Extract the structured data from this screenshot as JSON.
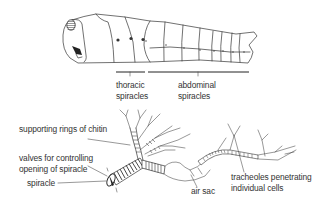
{
  "figure": {
    "top_panel": {
      "name": "caterpillar body with spiracles",
      "labels": {
        "thoracic": [
          "thoracic",
          "spiracles"
        ],
        "abdominal": [
          "abdominal",
          "spiracles"
        ]
      }
    },
    "bottom_panel": {
      "name": "trachea detail",
      "labels": {
        "supporting_rings": "supporting rings of chitin",
        "valves": [
          "valves for controlling",
          "opening of spiracle"
        ],
        "spiracle": "spiracle",
        "air_sac": "air sac",
        "tracheoles": [
          "tracheoles penetrating",
          "individual cells"
        ]
      }
    },
    "colors": {
      "line": "#333333",
      "text": "#333333",
      "background": "#ffffff"
    }
  }
}
